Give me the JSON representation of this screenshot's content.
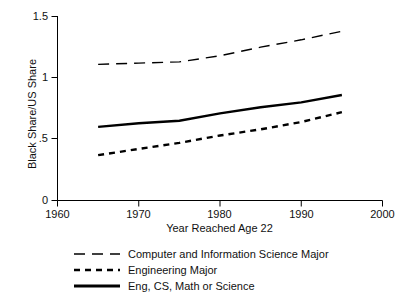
{
  "chart_data": {
    "type": "line",
    "title": "",
    "xlabel": "Year Reached Age 22",
    "ylabel": "Black Share/US Share",
    "xlim": [
      1960,
      2000
    ],
    "ylim": [
      0,
      1.5
    ],
    "xticks": [
      1960,
      1970,
      1980,
      1990,
      2000
    ],
    "xtick_labels": [
      "1960",
      "1970",
      "1980",
      "1990",
      "2000"
    ],
    "yticks": [
      0,
      0.5,
      1,
      1.5
    ],
    "ytick_labels": [
      "0",
      ".5",
      "1",
      "1.5"
    ],
    "grid": false,
    "legend_position": "below-axes",
    "x": [
      1965,
      1970,
      1975,
      1980,
      1985,
      1990,
      1995
    ],
    "series": [
      {
        "name": "Computer and Information Science Major",
        "style": "long-dash",
        "values": [
          1.11,
          1.12,
          1.13,
          1.18,
          1.25,
          1.31,
          1.38
        ]
      },
      {
        "name": "Engineering Major",
        "style": "short-dash",
        "values": [
          0.37,
          0.42,
          0.47,
          0.53,
          0.58,
          0.64,
          0.72
        ]
      },
      {
        "name": "Eng, CS, Math or Science",
        "style": "solid",
        "values": [
          0.6,
          0.63,
          0.65,
          0.71,
          0.76,
          0.8,
          0.86
        ]
      }
    ]
  },
  "axis": {
    "y_tick_labels": [
      "1.5",
      "1",
      ".5",
      "0"
    ],
    "x_tick_labels": [
      "1960",
      "1970",
      "1980",
      "1990",
      "2000"
    ],
    "y_title": "Black Share/US Share",
    "x_title": "Year Reached Age 22"
  },
  "legend": {
    "items": [
      {
        "label": "Computer and Information Science Major",
        "style": "long-dash"
      },
      {
        "label": "Engineering Major",
        "style": "short-dash"
      },
      {
        "label": "Eng, CS, Math or Science",
        "style": "solid"
      }
    ]
  },
  "colors": {
    "line": "#000000",
    "axis": "#000000",
    "background": "#ffffff"
  }
}
